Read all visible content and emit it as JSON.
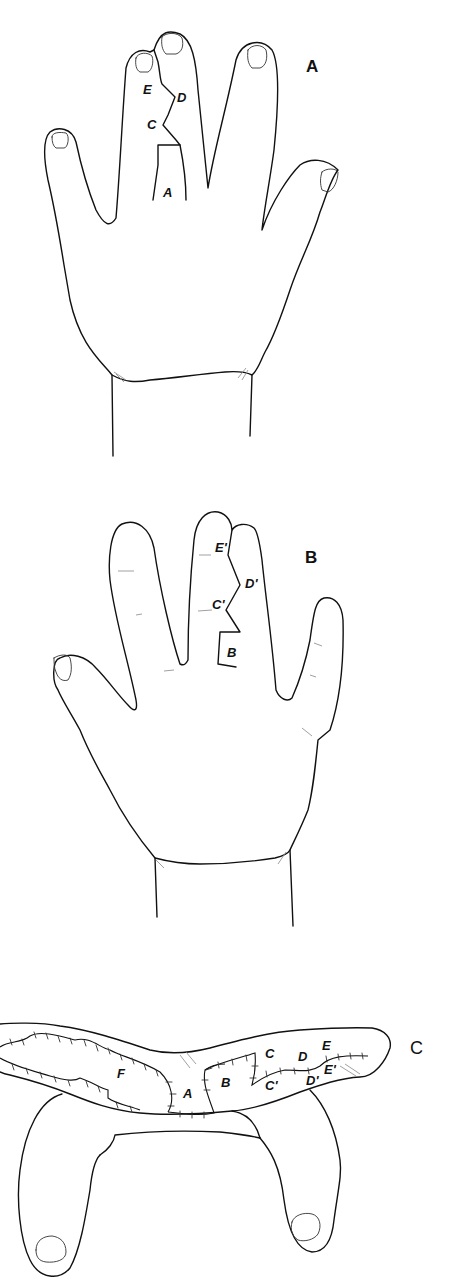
{
  "figure": {
    "panels": [
      {
        "id": "A",
        "label": "A",
        "flap_labels": {
          "E": "E",
          "D": "D",
          "C": "C",
          "A": "A"
        }
      },
      {
        "id": "B",
        "label": "B",
        "flap_labels": {
          "E": "E'",
          "D": "D'",
          "C": "C'",
          "B": "B"
        }
      },
      {
        "id": "C",
        "label": "C",
        "flap_labels": {
          "F": "F",
          "A": "A",
          "B": "B",
          "C": "C",
          "C2": "C'",
          "D": "D",
          "D2": "D'",
          "E": "E",
          "E2": "E'"
        }
      }
    ]
  }
}
